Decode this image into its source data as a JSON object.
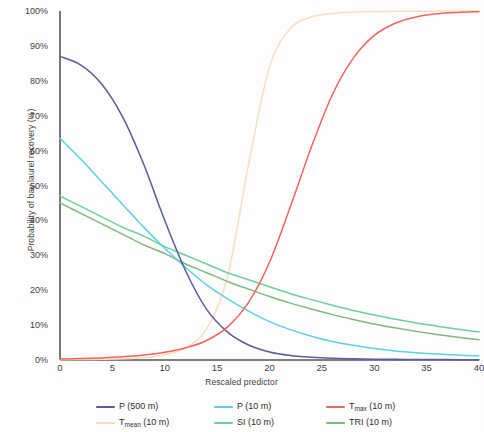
{
  "chart_data": {
    "type": "line",
    "title": "",
    "xlabel": "Rescaled predictor",
    "ylabel": "Probability of bay laurel recovery (%)",
    "xlim": [
      0,
      40
    ],
    "ylim": [
      0,
      100
    ],
    "xticks": [
      "0",
      "5",
      "10",
      "15",
      "20",
      "25",
      "30",
      "35",
      "40"
    ],
    "xtick_values": [
      0,
      5,
      10,
      15,
      20,
      25,
      30,
      35,
      40
    ],
    "yticks": [
      "0%",
      "10%",
      "20%",
      "30%",
      "40%",
      "50%",
      "60%",
      "70%",
      "80%",
      "90%",
      "100%"
    ],
    "ytick_values": [
      0,
      10,
      20,
      30,
      40,
      50,
      60,
      70,
      80,
      90,
      100
    ],
    "grid": false,
    "legend_position": "bottom",
    "x": [
      0,
      2,
      4,
      6,
      8,
      10,
      12,
      14,
      16,
      18,
      20,
      22,
      24,
      26,
      28,
      30,
      32,
      34,
      36,
      38,
      40
    ],
    "series": [
      {
        "name": "P (500 m)",
        "label_main": "P (500 m)",
        "label_sub": "",
        "color": "#5b5b9e",
        "values": [
          87,
          84.5,
          79,
          69.5,
          56,
          40,
          25.5,
          14.5,
          8,
          4.3,
          2.3,
          1.3,
          0.8,
          0.5,
          0.35,
          0.25,
          0.2,
          0.15,
          0.12,
          0.1,
          0.1
        ]
      },
      {
        "name": "P (10 m)",
        "label_main": "P (10 m)",
        "label_sub": "",
        "color": "#5ecfe8",
        "values": [
          63.5,
          57.5,
          51,
          44.5,
          38,
          32,
          26.5,
          21.5,
          17.5,
          14,
          11,
          8.7,
          6.8,
          5.3,
          4.2,
          3.3,
          2.6,
          2.1,
          1.7,
          1.4,
          1.2
        ]
      },
      {
        "name": "Tmax (10 m)",
        "label_main": "T",
        "label_sub": "max",
        "label_suffix": " (10 m)",
        "color": "#f2635e",
        "values": [
          0.3,
          0.4,
          0.6,
          0.9,
          1.4,
          2.2,
          3.5,
          5.6,
          9.5,
          16.5,
          28,
          44,
          61,
          76,
          86.5,
          93,
          96.5,
          98.3,
          99.2,
          99.6,
          99.8
        ]
      },
      {
        "name": "Tmean (10 m)",
        "label_main": "T",
        "label_sub": "mean",
        "label_suffix": " (10 m)",
        "color": "#f6dfc0",
        "values": [
          0.1,
          0.12,
          0.2,
          0.35,
          0.7,
          1.5,
          3.5,
          9,
          24,
          56,
          84,
          95,
          98.3,
          99.3,
          99.7,
          99.85,
          99.9,
          99.95,
          99.97,
          99.98,
          100
        ]
      },
      {
        "name": "SI (10 m)",
        "label_main": "SI (10 m)",
        "label_sub": "",
        "color": "#6fcf9a",
        "values": [
          47,
          44,
          41,
          38,
          35.5,
          32.5,
          30,
          27.5,
          25,
          23,
          21,
          19,
          17.3,
          15.7,
          14.2,
          12.9,
          11.7,
          10.6,
          9.7,
          8.8,
          8
        ]
      },
      {
        "name": "TRI (10 m)",
        "label_main": "TRI (10 m)",
        "label_sub": "",
        "color": "#7fb97f",
        "values": [
          45,
          42,
          39,
          36,
          33,
          30.5,
          27.5,
          25,
          22.5,
          20.3,
          18.2,
          16.3,
          14.6,
          13,
          11.6,
          10.3,
          9.2,
          8.2,
          7.3,
          6.5,
          5.8
        ]
      }
    ]
  },
  "axes": {
    "axis_color": "#555555"
  },
  "legend": {
    "items": [
      {
        "name": "P (500 m)",
        "main": "P (500 m)",
        "sub": "",
        "suffix": "",
        "color": "#5b5b9e"
      },
      {
        "name": "P (10 m)",
        "main": "P (10 m)",
        "sub": "",
        "suffix": "",
        "color": "#5ecfe8"
      },
      {
        "name": "Tmax (10 m)",
        "main": "T",
        "sub": "max",
        "suffix": " (10 m)",
        "color": "#f2635e"
      },
      {
        "name": "Tmean (10 m)",
        "main": "T",
        "sub": "mean",
        "suffix": " (10 m)",
        "color": "#f6dfc0"
      },
      {
        "name": "SI (10 m)",
        "main": "SI (10 m)",
        "sub": "",
        "suffix": "",
        "color": "#6fcf9a"
      },
      {
        "name": "TRI (10 m)",
        "main": "TRI (10 m)",
        "sub": "",
        "suffix": "",
        "color": "#7fb97f"
      }
    ]
  }
}
